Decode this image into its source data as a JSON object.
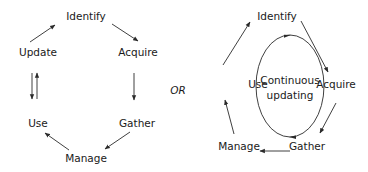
{
  "left_diagram": {
    "nodes": {
      "identify": "Identify",
      "acquire": "Acquire",
      "gather": "Gather",
      "manage": "Manage",
      "use": "Use",
      "update": "Update"
    },
    "edges": [
      {
        "from": "Update",
        "to": "Identify"
      },
      {
        "from": "Identify",
        "to": "Acquire"
      },
      {
        "from": "Acquire",
        "to": "Gather"
      },
      {
        "from": "Gather",
        "to": "Manage"
      },
      {
        "from": "Manage",
        "to": "Use"
      },
      {
        "from": "Update",
        "to": "Use"
      },
      {
        "from": "Use",
        "to": "Update"
      }
    ]
  },
  "separator": "OR",
  "right_diagram": {
    "nodes": {
      "identify": "Identify",
      "acquire": "Acquire",
      "gather": "Gather",
      "manage": "Manage",
      "use": "Use"
    },
    "center_line1": "Continuous",
    "center_line2": "updating",
    "edges": [
      {
        "from": "Use",
        "to": "Identify"
      },
      {
        "from": "Identify",
        "to": "Acquire"
      },
      {
        "from": "Acquire",
        "to": "Gather"
      },
      {
        "from": "Gather",
        "to": "Manage"
      },
      {
        "from": "Manage",
        "to": "Use"
      }
    ],
    "cycle_direction": "clockwise"
  }
}
